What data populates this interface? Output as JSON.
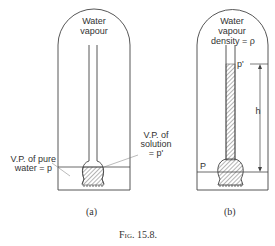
{
  "figure": {
    "caption": "Fig. 15.8.",
    "panels": [
      {
        "id": "a",
        "label": "(a)",
        "top_label_line1": "Water",
        "top_label_line2": "vapour",
        "left_label_line1": "V.P. of pure",
        "left_label_line2": "water = p",
        "right_label_line1": "V.P. of",
        "right_label_line2": "solution",
        "right_label_line3": "= p'"
      },
      {
        "id": "b",
        "label": "(b)",
        "top_label_line1": "Water",
        "top_label_line2": "vapour",
        "top_label_line3": "density = ρ",
        "column_top_label": "p'",
        "height_label": "h",
        "level_label": "P"
      }
    ]
  },
  "colors": {
    "ink": "#333333",
    "background": "#ffffff"
  }
}
